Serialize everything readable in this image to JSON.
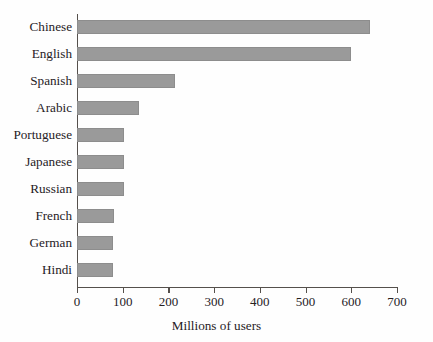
{
  "chart_data": {
    "type": "bar",
    "orientation": "horizontal",
    "title": "",
    "xlabel": "Millions of users",
    "ylabel": "",
    "categories": [
      "Chinese",
      "English",
      "Spanish",
      "Arabic",
      "Portuguese",
      "Japanese",
      "Russian",
      "French",
      "German",
      "Hindi"
    ],
    "values": [
      640,
      600,
      215,
      135,
      103,
      103,
      103,
      80,
      78,
      78
    ],
    "xlim": [
      0,
      700
    ],
    "xticks": [
      0,
      100,
      200,
      300,
      400,
      500,
      600,
      700
    ],
    "xtick_labels": [
      "0",
      "100",
      "200",
      "300",
      "400",
      "500",
      "600",
      "700"
    ],
    "grid": false,
    "legend": null,
    "bar_color": "#9a9a9a",
    "axis_color": "#55504c",
    "background": "#fefefe"
  }
}
